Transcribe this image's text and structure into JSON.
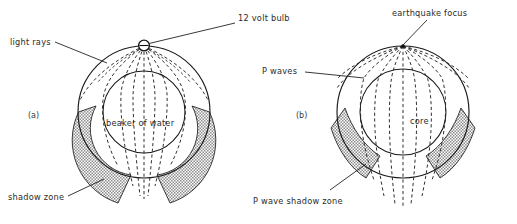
{
  "figure": {
    "background_color": "#ffffff",
    "line_color": "#1a1a1a",
    "shade_color": "#9a9a9a",
    "panels": [
      {
        "id": "a",
        "panel_label": "(a)",
        "center_label": "beaker of water",
        "source_label": "12 volt bulb",
        "rays_label": "light rays",
        "shadow_label": "shadow zone",
        "source_icon": "lamp-icon",
        "description": "Light rays from a 12 volt bulb refract through a beaker of water producing a shadow zone"
      },
      {
        "id": "b",
        "panel_label": "(b)",
        "center_label": "core",
        "source_label": "earthquake focus",
        "rays_label": "P waves",
        "shadow_label": "P wave shadow zone",
        "source_icon": "focus-point-icon",
        "description": "P waves from an earthquake focus refract through the Earth's core producing a P wave shadow zone"
      }
    ]
  }
}
